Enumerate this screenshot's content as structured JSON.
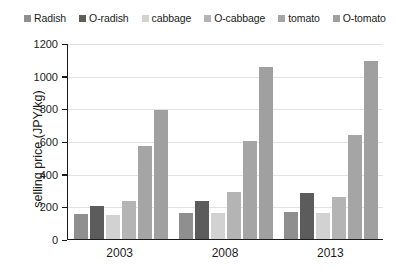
{
  "chart_data": {
    "type": "bar",
    "title": "",
    "xlabel": "",
    "ylabel": "selling price (JPY/kg)",
    "categories": [
      "2003",
      "2008",
      "2013"
    ],
    "ylim": [
      0,
      1200
    ],
    "yticks": [
      0,
      200,
      400,
      600,
      800,
      1000,
      1200
    ],
    "grid": true,
    "legend_position": "top",
    "series": [
      {
        "name": "Radish",
        "color": "#8f8f8f",
        "values": [
          152,
          160,
          163
        ]
      },
      {
        "name": "O-radish",
        "color": "#5c5c5c",
        "values": [
          205,
          232,
          281
        ]
      },
      {
        "name": "cabbage",
        "color": "#d2d2d2",
        "values": [
          148,
          158,
          158
        ]
      },
      {
        "name": "O-cabbage",
        "color": "#b4b4b4",
        "values": [
          232,
          288,
          256
        ]
      },
      {
        "name": "tomato",
        "color": "#a5a5a5",
        "values": [
          572,
          598,
          634
        ]
      },
      {
        "name": "O-tomato",
        "color": "#a0a0a0",
        "values": [
          788,
          1052,
          1092
        ]
      }
    ]
  },
  "axis": {
    "y_title": "selling price (JPY/kg)",
    "y_tick_labels": [
      "1200",
      "1000",
      "800",
      "600",
      "400",
      "200",
      "0"
    ],
    "x_tick_labels": [
      "2003",
      "2008",
      "2013"
    ]
  },
  "legend": {
    "items": [
      {
        "label": "Radish",
        "color": "#8f8f8f"
      },
      {
        "label": "O-radish",
        "color": "#5c5c5c"
      },
      {
        "label": "cabbage",
        "color": "#d2d2d2"
      },
      {
        "label": "O-cabbage",
        "color": "#b4b4b4"
      },
      {
        "label": "tomato",
        "color": "#a5a5a5"
      },
      {
        "label": "O-tomato",
        "color": "#a0a0a0"
      }
    ]
  }
}
